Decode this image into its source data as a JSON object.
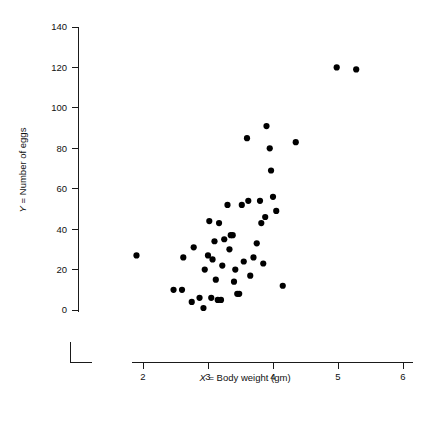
{
  "chart_data": {
    "type": "scatter",
    "title": "",
    "xlabel": "X = Body weight (gm)",
    "xlabel_var": "X",
    "xlabel_rest": " = Body weight (gm)",
    "ylabel": "Y = Number of eggs",
    "ylabel_var": "Y",
    "ylabel_rest": " = Number of eggs",
    "xlim": [
      1.55,
      6.35
    ],
    "ylim": [
      -6,
      142
    ],
    "xticks": [
      2,
      3,
      4,
      5,
      6
    ],
    "xtick_labels": [
      "2",
      "3",
      "4",
      "5",
      "6"
    ],
    "yticks": [
      0,
      20,
      40,
      60,
      80,
      100,
      120,
      140
    ],
    "ytick_labels": [
      "0",
      "20",
      "40",
      "60",
      "80",
      "100",
      "120",
      "140"
    ],
    "grid": false,
    "legend": false,
    "marker": "filled-circle",
    "marker_color": "#000000",
    "marker_size": 3.1,
    "n_points": 48,
    "points": [
      {
        "x": 1.9,
        "y": 27
      },
      {
        "x": 2.47,
        "y": 10
      },
      {
        "x": 2.6,
        "y": 10
      },
      {
        "x": 2.62,
        "y": 26
      },
      {
        "x": 2.75,
        "y": 4
      },
      {
        "x": 2.78,
        "y": 31
      },
      {
        "x": 2.87,
        "y": 6
      },
      {
        "x": 2.93,
        "y": 1
      },
      {
        "x": 2.95,
        "y": 20
      },
      {
        "x": 3.0,
        "y": 27
      },
      {
        "x": 3.02,
        "y": 44
      },
      {
        "x": 3.05,
        "y": 6
      },
      {
        "x": 3.07,
        "y": 25
      },
      {
        "x": 3.1,
        "y": 34
      },
      {
        "x": 3.12,
        "y": 15
      },
      {
        "x": 3.15,
        "y": 5
      },
      {
        "x": 3.17,
        "y": 43
      },
      {
        "x": 3.2,
        "y": 5
      },
      {
        "x": 3.22,
        "y": 22
      },
      {
        "x": 3.25,
        "y": 35
      },
      {
        "x": 3.3,
        "y": 52
      },
      {
        "x": 3.33,
        "y": 30
      },
      {
        "x": 3.35,
        "y": 37
      },
      {
        "x": 3.38,
        "y": 37
      },
      {
        "x": 3.4,
        "y": 14
      },
      {
        "x": 3.42,
        "y": 20
      },
      {
        "x": 3.45,
        "y": 8
      },
      {
        "x": 3.48,
        "y": 8
      },
      {
        "x": 3.52,
        "y": 52
      },
      {
        "x": 3.55,
        "y": 24
      },
      {
        "x": 3.6,
        "y": 85
      },
      {
        "x": 3.62,
        "y": 54
      },
      {
        "x": 3.65,
        "y": 17
      },
      {
        "x": 3.7,
        "y": 26
      },
      {
        "x": 3.75,
        "y": 33
      },
      {
        "x": 3.8,
        "y": 54
      },
      {
        "x": 3.82,
        "y": 43
      },
      {
        "x": 3.85,
        "y": 23
      },
      {
        "x": 3.88,
        "y": 46
      },
      {
        "x": 3.9,
        "y": 91
      },
      {
        "x": 3.95,
        "y": 80
      },
      {
        "x": 3.97,
        "y": 69
      },
      {
        "x": 4.0,
        "y": 56
      },
      {
        "x": 4.05,
        "y": 49
      },
      {
        "x": 4.15,
        "y": 12
      },
      {
        "x": 4.35,
        "y": 83
      },
      {
        "x": 4.98,
        "y": 120
      },
      {
        "x": 5.28,
        "y": 119
      }
    ]
  }
}
